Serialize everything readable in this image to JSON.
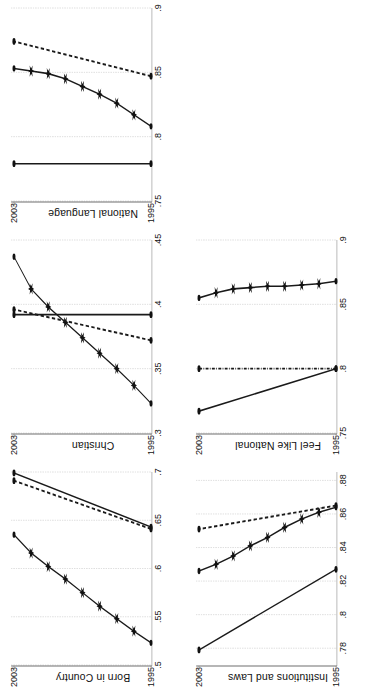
{
  "figure": {
    "orientation": "rotated-90-ccw",
    "background": "#ffffff",
    "ink": "#111111",
    "gridline_color": "#9a9a9a",
    "axis_color": "#6f6f6f"
  },
  "chart_data": [
    {
      "type": "line",
      "title": "Born in Country",
      "xlabel": "",
      "ylabel": "",
      "xlim": [
        1995,
        2003
      ],
      "ylim": [
        0.5,
        0.7
      ],
      "yticks": [
        ".5",
        ".55",
        ".6",
        ".65",
        ".7"
      ],
      "ytick_values": [
        0.5,
        0.55,
        0.6,
        0.65,
        0.7
      ],
      "xticks": [
        "1995",
        "2003"
      ],
      "xtick_values": [
        1995,
        2003
      ],
      "grid": true,
      "legend": "none",
      "x": [
        1995,
        1996,
        1997,
        1998,
        1999,
        2000,
        2001,
        2002,
        2003
      ],
      "series": [
        {
          "name": "star-series",
          "style": "solid-star",
          "values": [
            0.523,
            0.535,
            0.548,
            0.561,
            0.575,
            0.589,
            0.602,
            0.616,
            0.635
          ]
        },
        {
          "name": "solid-endpoints",
          "style": "solid-dot",
          "values": [
            0.643,
            null,
            null,
            null,
            null,
            null,
            null,
            null,
            0.699
          ]
        },
        {
          "name": "dashed-endpoints",
          "style": "dashed-dot",
          "values": [
            0.641,
            null,
            null,
            null,
            null,
            null,
            null,
            null,
            0.691
          ]
        }
      ]
    },
    {
      "type": "line",
      "title": "Christian",
      "xlabel": "",
      "ylabel": "",
      "xlim": [
        1995,
        2003
      ],
      "ylim": [
        0.3,
        0.45
      ],
      "yticks": [
        ".3",
        ".35",
        ".4",
        ".45"
      ],
      "ytick_values": [
        0.3,
        0.35,
        0.4,
        0.45
      ],
      "xticks": [
        "1995",
        "2003"
      ],
      "xtick_values": [
        1995,
        2003
      ],
      "grid": true,
      "legend": "none",
      "x": [
        1995,
        1996,
        1997,
        1998,
        1999,
        2000,
        2001,
        2002,
        2003
      ],
      "series": [
        {
          "name": "star-series",
          "style": "solid-star",
          "values": [
            0.323,
            0.337,
            0.35,
            0.362,
            0.374,
            0.386,
            0.398,
            0.412,
            0.437
          ]
        },
        {
          "name": "solid-endpoints",
          "style": "solid-dot",
          "values": [
            0.392,
            null,
            null,
            null,
            null,
            null,
            null,
            null,
            0.392
          ]
        },
        {
          "name": "dashed-endpoints",
          "style": "dashed-dot",
          "values": [
            0.372,
            null,
            null,
            null,
            null,
            null,
            null,
            null,
            0.396
          ]
        }
      ]
    },
    {
      "type": "line",
      "title": "National Language",
      "xlabel": "",
      "ylabel": "",
      "xlim": [
        1995,
        2003
      ],
      "ylim": [
        0.75,
        0.9
      ],
      "yticks": [
        ".75",
        ".8",
        ".85",
        ".9"
      ],
      "ytick_values": [
        0.75,
        0.8,
        0.85,
        0.9
      ],
      "xticks": [
        "1995",
        "2003"
      ],
      "xtick_values": [
        1995,
        2003
      ],
      "grid": true,
      "legend": "none",
      "x": [
        1995,
        1996,
        1997,
        1998,
        1999,
        2000,
        2001,
        2002,
        2003
      ],
      "series": [
        {
          "name": "star-series",
          "style": "solid-star",
          "values": [
            0.808,
            0.817,
            0.826,
            0.833,
            0.839,
            0.845,
            0.849,
            0.851,
            0.853
          ]
        },
        {
          "name": "solid-endpoints",
          "style": "solid-dot",
          "values": [
            0.779,
            null,
            null,
            null,
            null,
            null,
            null,
            null,
            0.779
          ]
        },
        {
          "name": "dashed-endpoints",
          "style": "dashed-dot",
          "values": [
            0.847,
            null,
            null,
            null,
            null,
            null,
            null,
            null,
            0.874
          ]
        }
      ]
    },
    {
      "type": "line",
      "title": "Institutions and Laws",
      "xlabel": "",
      "ylabel": "",
      "xlim": [
        1995,
        2003
      ],
      "ylim": [
        0.77,
        0.885
      ],
      "yticks": [
        ".78",
        ".8",
        ".82",
        ".84",
        ".86",
        ".88"
      ],
      "ytick_values": [
        0.78,
        0.8,
        0.82,
        0.84,
        0.86,
        0.88
      ],
      "xticks": [
        "1995",
        "2003"
      ],
      "xtick_values": [
        1995,
        2003
      ],
      "grid": true,
      "legend": "none",
      "x": [
        1995,
        1996,
        1997,
        1998,
        1999,
        2000,
        2001,
        2002,
        2003
      ],
      "series": [
        {
          "name": "star-series",
          "style": "solid-star",
          "values": [
            0.864,
            0.861,
            0.857,
            0.852,
            0.846,
            0.841,
            0.835,
            0.83,
            0.826
          ]
        },
        {
          "name": "solid-endpoints",
          "style": "solid-dot",
          "values": [
            0.827,
            null,
            null,
            null,
            null,
            null,
            null,
            null,
            0.779
          ]
        },
        {
          "name": "dashed-endpoints",
          "style": "dashed-dot",
          "values": [
            0.865,
            null,
            null,
            null,
            null,
            null,
            null,
            null,
            0.851
          ]
        }
      ]
    },
    {
      "type": "line",
      "title": "Feel Like National",
      "xlabel": "",
      "ylabel": "",
      "xlim": [
        1995,
        2003
      ],
      "ylim": [
        0.75,
        0.9
      ],
      "yticks": [
        ".75",
        ".8",
        ".85",
        ".9"
      ],
      "ytick_values": [
        0.75,
        0.8,
        0.85,
        0.9
      ],
      "xticks": [
        "1995",
        "2003"
      ],
      "xtick_values": [
        1995,
        2003
      ],
      "grid": true,
      "legend": "none",
      "x": [
        1995,
        1996,
        1997,
        1998,
        1999,
        2000,
        2001,
        2002,
        2003
      ],
      "series": [
        {
          "name": "star-series",
          "style": "solid-star",
          "values": [
            0.868,
            0.866,
            0.865,
            0.864,
            0.864,
            0.863,
            0.862,
            0.859,
            0.855
          ]
        },
        {
          "name": "solid-endpoints",
          "style": "solid-dot",
          "values": [
            0.8,
            null,
            null,
            null,
            null,
            null,
            null,
            null,
            0.767
          ]
        },
        {
          "name": "dashdot-endpoints",
          "style": "dashdot-dot",
          "values": [
            0.8,
            null,
            null,
            null,
            null,
            null,
            null,
            null,
            0.8
          ]
        }
      ]
    }
  ]
}
